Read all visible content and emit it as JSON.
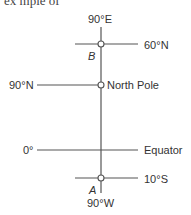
{
  "header": {
    "cut_text": "ex  mple  of"
  },
  "diagram": {
    "axis_top_label": "90°E",
    "axis_bottom_label": "90°W",
    "lines": [
      {
        "left_label": "",
        "right_label": "60°N",
        "point": "B"
      },
      {
        "left_label": "90°N",
        "right_label": "North Pole",
        "point": ""
      },
      {
        "left_label": "0°",
        "right_label": "Equator",
        "point": ""
      },
      {
        "left_label": "",
        "right_label": "10°S",
        "point": "A"
      }
    ],
    "points": {
      "B": "B",
      "A": "A"
    }
  }
}
